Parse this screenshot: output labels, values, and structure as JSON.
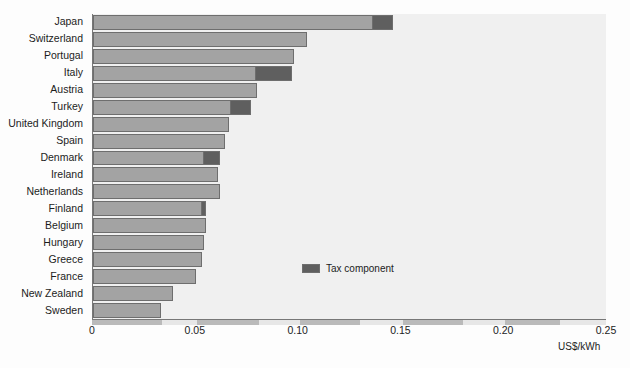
{
  "chart_data": {
    "type": "bar",
    "orientation": "horizontal",
    "stacked": true,
    "title": "",
    "xlabel": "US$/kWh",
    "ylabel": "",
    "xlim": [
      0,
      0.25
    ],
    "xticks": [
      "0",
      "0.05",
      "0.10",
      "0.15",
      "0.20",
      "0.25"
    ],
    "xtick_values": [
      0,
      0.05,
      0.1,
      0.15,
      0.2,
      0.25
    ],
    "grid": false,
    "legend": {
      "position": "inside-right",
      "entries": [
        {
          "label": "Tax component",
          "color": "#5f5f5f"
        }
      ]
    },
    "series": [
      {
        "name": "Price excluding tax",
        "color": "#a3a3a3"
      },
      {
        "name": "Tax component",
        "color": "#5f5f5f"
      }
    ],
    "categories": [
      "Japan",
      "Switzerland",
      "Portugal",
      "Italy",
      "Austria",
      "Turkey",
      "United Kingdom",
      "Spain",
      "Denmark",
      "Ireland",
      "Netherlands",
      "Finland",
      "Belgium",
      "Hungary",
      "Greece",
      "France",
      "New Zealand",
      "Sweden"
    ],
    "rows": [
      {
        "category": "Japan",
        "base": 0.136,
        "tax": 0.01,
        "total": 0.146
      },
      {
        "category": "Switzerland",
        "base": 0.104,
        "tax": 0.0,
        "total": 0.104
      },
      {
        "category": "Portugal",
        "base": 0.098,
        "tax": 0.0,
        "total": 0.098
      },
      {
        "category": "Italy",
        "base": 0.079,
        "tax": 0.018,
        "total": 0.097
      },
      {
        "category": "Austria",
        "base": 0.08,
        "tax": 0.0,
        "total": 0.08
      },
      {
        "category": "Turkey",
        "base": 0.067,
        "tax": 0.01,
        "total": 0.077
      },
      {
        "category": "United Kingdom",
        "base": 0.066,
        "tax": 0.0,
        "total": 0.066
      },
      {
        "category": "Spain",
        "base": 0.064,
        "tax": 0.0,
        "total": 0.064
      },
      {
        "category": "Denmark",
        "base": 0.054,
        "tax": 0.008,
        "total": 0.062
      },
      {
        "category": "Ireland",
        "base": 0.061,
        "tax": 0.0,
        "total": 0.061
      },
      {
        "category": "Netherlands",
        "base": 0.062,
        "tax": 0.0,
        "total": 0.062
      },
      {
        "category": "Finland",
        "base": 0.053,
        "tax": 0.002,
        "total": 0.055
      },
      {
        "category": "Belgium",
        "base": 0.055,
        "tax": 0.0,
        "total": 0.055
      },
      {
        "category": "Hungary",
        "base": 0.054,
        "tax": 0.0,
        "total": 0.054
      },
      {
        "category": "Greece",
        "base": 0.053,
        "tax": 0.0,
        "total": 0.053
      },
      {
        "category": "France",
        "base": 0.05,
        "tax": 0.0,
        "total": 0.05
      },
      {
        "category": "New Zealand",
        "base": 0.039,
        "tax": 0.0,
        "total": 0.039
      },
      {
        "category": "Sweden",
        "base": 0.033,
        "tax": 0.0,
        "total": 0.033
      }
    ]
  },
  "colors": {
    "bar_base": "#a3a3a3",
    "bar_tax": "#5f5f5f",
    "bar_outline": "#6e6e6e",
    "plot_background": "#f0f0f0",
    "axis": "#777777",
    "text": "#1c1c1c"
  },
  "background_page": {
    "title": "REGULATORY REFORM IN THE...",
    "subtitle": "Figure 3.1",
    "paragraph_1": "is the lowest among the countries compared, while",
    "paragraph_2": "remain relatively high in several member states",
    "paragraph_3": "the industrial sector continues to face a burden of",
    "paragraph_4": "costs which are passed through to final consumers",
    "paragraph_5": "and this in turn affects competitiveness in the",
    "paragraph_6": "sectors exposed to international competition.",
    "footer": "Source: International Energy Agency"
  }
}
